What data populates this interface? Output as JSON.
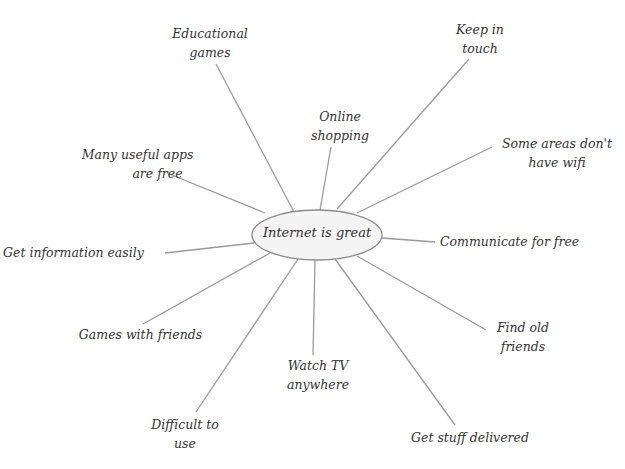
{
  "diagram": {
    "type": "mind-map",
    "line_color": "#9a9a9a",
    "ellipse_fill": "#f4f4f4",
    "ellipse_stroke": "#8c8c8c",
    "text_color": "#333333",
    "center": {
      "label": "Internet is great"
    },
    "nodes": [
      {
        "id": "educational-games",
        "lines": [
          "Educational",
          "games"
        ]
      },
      {
        "id": "keep-in-touch",
        "lines": [
          "Keep in",
          "touch"
        ]
      },
      {
        "id": "online-shopping",
        "lines": [
          "Online",
          "shopping"
        ]
      },
      {
        "id": "some-areas-no-wifi",
        "lines": [
          "Some areas don't",
          "have wifi"
        ]
      },
      {
        "id": "many-useful-apps",
        "lines": [
          "Many useful apps",
          "are free"
        ]
      },
      {
        "id": "communicate-free",
        "lines": [
          "Communicate for free"
        ]
      },
      {
        "id": "get-information",
        "lines": [
          "Get information easily"
        ]
      },
      {
        "id": "find-old-friends",
        "lines": [
          "Find old",
          "friends"
        ]
      },
      {
        "id": "games-with-friends",
        "lines": [
          "Games with friends"
        ]
      },
      {
        "id": "watch-tv",
        "lines": [
          "Watch TV",
          "anywhere"
        ]
      },
      {
        "id": "difficult-to-use",
        "lines": [
          "Difficult to",
          "use"
        ]
      },
      {
        "id": "get-stuff-delivered",
        "lines": [
          "Get stuff delivered"
        ]
      }
    ]
  }
}
